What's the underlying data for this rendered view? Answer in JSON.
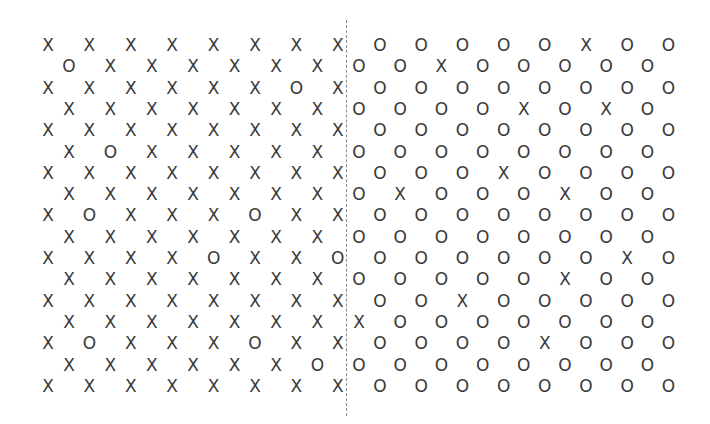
{
  "diagram": {
    "type": "symbol-grid",
    "divider": {
      "style": "dashed",
      "color": "#8a8a8a",
      "x": 346,
      "y_start": 20,
      "y_end": 416
    },
    "glyph_color": "#3a3a3a",
    "layout": {
      "row_start_y": 45,
      "row_spacing": 21.3,
      "left": {
        "even_start_x": 48,
        "odd_start_x": 69,
        "spacing": 41.4
      },
      "right": {
        "even_start_x": 380,
        "odd_start_x": 359,
        "spacing": 41.2
      }
    },
    "left_region": {
      "dominant_symbol": "X",
      "rows": [
        "XXXXXXXX",
        "OXXXXXX",
        "XXXXXXOX",
        "XXXXXXX",
        "XXXXXXXX",
        "XOXXXXX",
        "XXXXXXXX",
        "XXXXXXX",
        "XOXXXOXX",
        "XXXXXXX",
        "XXXXOXXO",
        "XXXXXXX",
        "XXXXXXXX",
        "XXXXXXX",
        "XOXXXOXX",
        "XXXXXXO",
        "XXXXXXXX"
      ]
    },
    "right_region": {
      "dominant_symbol": "O",
      "rows": [
        "OOOOOXOO",
        "OOXOOOOO",
        "OOOOOOOO",
        "OOOOXOXO",
        "OOOOOOOO",
        "OOOOOOOO",
        "OOOXOOOO",
        "OXOOOXOO",
        "OOOOOOOO",
        "OOOOOOOO",
        "OOOOOOXO",
        "OOOOOXOO",
        "OOXOOOOO",
        "XOOOOOOO",
        "OOOOXOOO",
        "OOOOOOOO",
        "OOOOOOOO"
      ]
    }
  }
}
